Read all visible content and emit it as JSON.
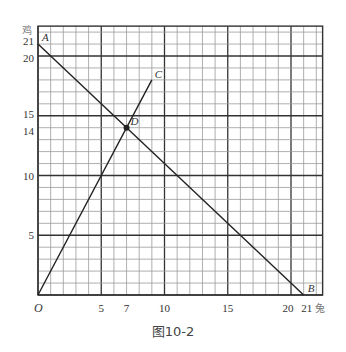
{
  "figure": {
    "caption": "图10-2",
    "x_axis_label": "兔",
    "y_axis_label": "鸡",
    "origin_label": "O"
  },
  "chart_data": {
    "type": "line",
    "title": "图10-2",
    "xlabel": "兔",
    "ylabel": "鸡",
    "x_ticks": [
      5,
      7,
      10,
      15,
      20,
      21
    ],
    "y_ticks": [
      5,
      10,
      14,
      15,
      20,
      21
    ],
    "xlim": [
      0,
      22.5
    ],
    "ylim": [
      0,
      22.5
    ],
    "grid": true,
    "series": [
      {
        "name": "AB",
        "equation": "x + y = 21",
        "points": [
          [
            0,
            21
          ],
          [
            21,
            0
          ]
        ]
      },
      {
        "name": "OC",
        "equation": "y = 2x",
        "points": [
          [
            0,
            0
          ],
          [
            9,
            18
          ]
        ]
      }
    ],
    "points": [
      {
        "label": "A",
        "x": 0,
        "y": 21
      },
      {
        "label": "B",
        "x": 21,
        "y": 0
      },
      {
        "label": "C",
        "x": 9,
        "y": 18
      },
      {
        "label": "D",
        "x": 7,
        "y": 14,
        "marked": true
      },
      {
        "label": "O",
        "x": 0,
        "y": 0
      }
    ]
  },
  "colors": {
    "grid_minor": "#9a9a9a",
    "grid_major": "#333333",
    "line": "#222222",
    "label": "#333333"
  }
}
